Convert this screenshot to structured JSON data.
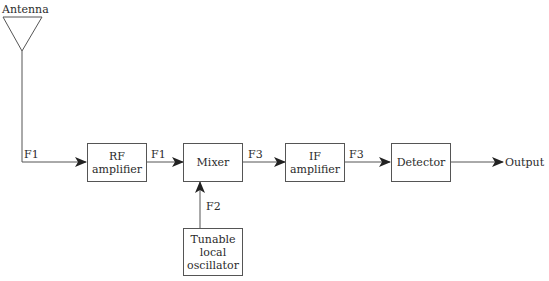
{
  "diagram": {
    "antenna": {
      "label": "Antenna"
    },
    "blocks": [
      {
        "id": "rf",
        "lines": [
          "RF",
          "amplifier"
        ]
      },
      {
        "id": "mixer",
        "lines": [
          "Mixer"
        ]
      },
      {
        "id": "if",
        "lines": [
          "IF",
          "amplifier"
        ]
      },
      {
        "id": "detector",
        "lines": [
          "Detector"
        ]
      },
      {
        "id": "lo",
        "lines": [
          "Tunable",
          "local",
          "oscillator"
        ]
      }
    ],
    "signals": {
      "antenna_to_rf": "F1",
      "rf_to_mixer": "F1",
      "lo_to_mixer": "F2",
      "mixer_to_if": "F3",
      "if_to_detector": "F3"
    },
    "output": {
      "label": "Output"
    },
    "colors": {
      "line": "#555555",
      "text": "#2b2b2b",
      "background": "#ffffff"
    }
  }
}
